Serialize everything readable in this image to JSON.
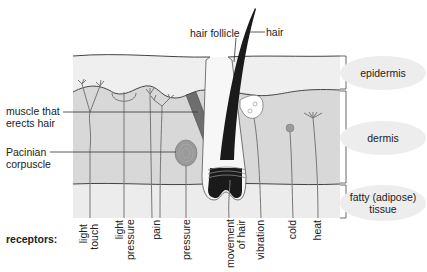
{
  "diagram": {
    "colors": {
      "epidermis_fill": "#eeeeee",
      "dermis_fill": "#d9d9d9",
      "fat_fill": "#e9e9e9",
      "line": "#444444",
      "nerve": "#777777",
      "hair": "#1a1a1a",
      "muscle": "#6e6e6e",
      "pacinian": "#9a9a9a",
      "label_ellipse": "#ededed"
    },
    "top_labels": {
      "hair_follicle": "hair follicle",
      "hair": "hair"
    },
    "left_labels": {
      "muscle_line1": "muscle that",
      "muscle_line2": "erects hair",
      "pacinian_line1": "Pacinian",
      "pacinian_line2": "corpuscle"
    },
    "layers": [
      {
        "label": "epidermis"
      },
      {
        "label": "dermis"
      },
      {
        "label_line1": "fatty (adipose)",
        "label_line2": "tissue"
      }
    ],
    "receptors_heading": "receptors:",
    "receptors": [
      {
        "line1": "light",
        "line2": "touch"
      },
      {
        "line1": "light",
        "line2": "pressure"
      },
      {
        "line1": "pain"
      },
      {
        "line1": "pressure"
      },
      {
        "line1": "movement",
        "line2": "of hair"
      },
      {
        "line1": "vibration"
      },
      {
        "line1": "cold"
      },
      {
        "line1": "heat"
      }
    ]
  }
}
